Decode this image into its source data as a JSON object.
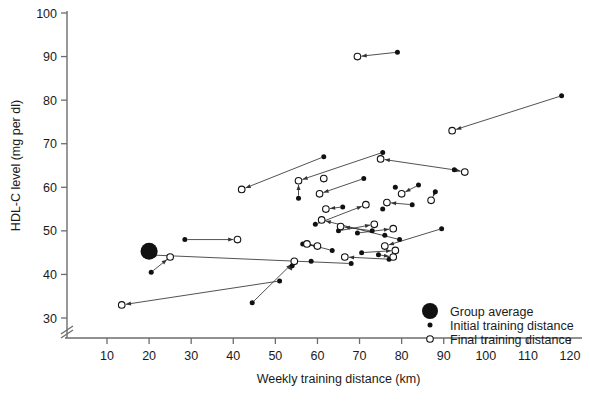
{
  "chart_data": {
    "type": "scatter",
    "title": "",
    "xlabel": "Weekly training distance (km)",
    "ylabel": "HDL-C level (mg per dl)",
    "xlim": [
      0,
      124
    ],
    "ylim": [
      28,
      100
    ],
    "xticks": [
      10,
      20,
      30,
      40,
      50,
      60,
      70,
      80,
      90,
      100,
      110,
      120
    ],
    "yticks": [
      30,
      40,
      50,
      60,
      70,
      80,
      90,
      100
    ],
    "grid": false,
    "y_axis_break": true,
    "legend_position": "bottom-right",
    "legend": [
      {
        "key": "group-average",
        "label": "Group average",
        "marker": "large-filled-circle"
      },
      {
        "key": "initial-training-distance",
        "label": "Initial training distance",
        "marker": "small-filled-circle"
      },
      {
        "key": "final-training-distance",
        "label": "Final training distance",
        "marker": "small-open-circle"
      }
    ],
    "group_average": {
      "x": 20.0,
      "y": 45.3
    },
    "series": [
      {
        "name": "Initial training distance",
        "marker": "filled",
        "points": [
          {
            "x": 79.0,
            "y": 91.0
          },
          {
            "x": 118.0,
            "y": 81.0
          },
          {
            "x": 61.5,
            "y": 67.0
          },
          {
            "x": 75.5,
            "y": 68.0
          },
          {
            "x": 92.5,
            "y": 64.0
          },
          {
            "x": 55.5,
            "y": 57.5
          },
          {
            "x": 71.0,
            "y": 62.0
          },
          {
            "x": 78.5,
            "y": 60.0
          },
          {
            "x": 84.0,
            "y": 60.5
          },
          {
            "x": 88.0,
            "y": 59.0
          },
          {
            "x": 66.0,
            "y": 55.5
          },
          {
            "x": 75.5,
            "y": 55.0
          },
          {
            "x": 82.5,
            "y": 56.0
          },
          {
            "x": 28.5,
            "y": 48.0
          },
          {
            "x": 59.5,
            "y": 51.5
          },
          {
            "x": 65.0,
            "y": 50.0
          },
          {
            "x": 69.5,
            "y": 49.5
          },
          {
            "x": 73.0,
            "y": 50.0
          },
          {
            "x": 76.0,
            "y": 49.0
          },
          {
            "x": 79.5,
            "y": 48.0
          },
          {
            "x": 89.5,
            "y": 50.5
          },
          {
            "x": 56.5,
            "y": 47.0
          },
          {
            "x": 63.5,
            "y": 45.5
          },
          {
            "x": 70.5,
            "y": 45.0
          },
          {
            "x": 74.5,
            "y": 44.5
          },
          {
            "x": 77.0,
            "y": 43.5
          },
          {
            "x": 20.5,
            "y": 40.5
          },
          {
            "x": 54.0,
            "y": 42.0
          },
          {
            "x": 58.5,
            "y": 43.0
          },
          {
            "x": 68.0,
            "y": 42.5
          },
          {
            "x": 51.0,
            "y": 38.5
          },
          {
            "x": 44.5,
            "y": 33.5
          }
        ]
      },
      {
        "name": "Final training distance",
        "marker": "open",
        "points": [
          {
            "x": 69.5,
            "y": 90.0
          },
          {
            "x": 92.0,
            "y": 73.0
          },
          {
            "x": 75.0,
            "y": 66.5
          },
          {
            "x": 95.0,
            "y": 63.5
          },
          {
            "x": 42.0,
            "y": 59.5
          },
          {
            "x": 55.5,
            "y": 61.5
          },
          {
            "x": 61.5,
            "y": 62.0
          },
          {
            "x": 60.5,
            "y": 58.5
          },
          {
            "x": 80.0,
            "y": 58.5
          },
          {
            "x": 87.0,
            "y": 57.0
          },
          {
            "x": 62.0,
            "y": 55.0
          },
          {
            "x": 71.5,
            "y": 56.0
          },
          {
            "x": 76.5,
            "y": 56.5
          },
          {
            "x": 61.0,
            "y": 52.5
          },
          {
            "x": 65.5,
            "y": 51.0
          },
          {
            "x": 73.5,
            "y": 51.5
          },
          {
            "x": 78.0,
            "y": 50.5
          },
          {
            "x": 41.0,
            "y": 48.0
          },
          {
            "x": 57.5,
            "y": 47.0
          },
          {
            "x": 60.0,
            "y": 46.5
          },
          {
            "x": 76.0,
            "y": 46.5
          },
          {
            "x": 78.5,
            "y": 45.5
          },
          {
            "x": 66.5,
            "y": 44.0
          },
          {
            "x": 78.0,
            "y": 44.0
          },
          {
            "x": 19.5,
            "y": 44.5
          },
          {
            "x": 25.0,
            "y": 44.0
          },
          {
            "x": 54.5,
            "y": 43.0
          },
          {
            "x": 13.5,
            "y": 33.0
          }
        ]
      }
    ],
    "arrows": [
      {
        "from": {
          "x": 79.0,
          "y": 91.0
        },
        "to": {
          "x": 69.5,
          "y": 90.0
        }
      },
      {
        "from": {
          "x": 118.0,
          "y": 81.0
        },
        "to": {
          "x": 92.0,
          "y": 73.0
        }
      },
      {
        "from": {
          "x": 61.5,
          "y": 67.0
        },
        "to": {
          "x": 42.0,
          "y": 59.5
        }
      },
      {
        "from": {
          "x": 75.5,
          "y": 68.0
        },
        "to": {
          "x": 55.5,
          "y": 61.5
        }
      },
      {
        "from": {
          "x": 92.5,
          "y": 64.0
        },
        "to": {
          "x": 75.0,
          "y": 66.5
        }
      },
      {
        "from": {
          "x": 92.5,
          "y": 64.0
        },
        "to": {
          "x": 95.0,
          "y": 63.5
        }
      },
      {
        "from": {
          "x": 55.5,
          "y": 57.5
        },
        "to": {
          "x": 55.5,
          "y": 61.5
        }
      },
      {
        "from": {
          "x": 71.0,
          "y": 62.0
        },
        "to": {
          "x": 60.5,
          "y": 58.5
        }
      },
      {
        "from": {
          "x": 88.0,
          "y": 59.0
        },
        "to": {
          "x": 87.0,
          "y": 57.0
        }
      },
      {
        "from": {
          "x": 84.0,
          "y": 60.5
        },
        "to": {
          "x": 80.0,
          "y": 58.5
        }
      },
      {
        "from": {
          "x": 66.0,
          "y": 55.5
        },
        "to": {
          "x": 62.0,
          "y": 55.0
        }
      },
      {
        "from": {
          "x": 82.5,
          "y": 56.0
        },
        "to": {
          "x": 76.5,
          "y": 56.5
        }
      },
      {
        "from": {
          "x": 28.5,
          "y": 48.0
        },
        "to": {
          "x": 41.0,
          "y": 48.0
        }
      },
      {
        "from": {
          "x": 59.5,
          "y": 51.5
        },
        "to": {
          "x": 71.5,
          "y": 56.0
        }
      },
      {
        "from": {
          "x": 65.0,
          "y": 50.0
        },
        "to": {
          "x": 73.5,
          "y": 51.5
        }
      },
      {
        "from": {
          "x": 69.5,
          "y": 49.5
        },
        "to": {
          "x": 78.0,
          "y": 50.5
        }
      },
      {
        "from": {
          "x": 73.0,
          "y": 50.0
        },
        "to": {
          "x": 65.5,
          "y": 51.0
        }
      },
      {
        "from": {
          "x": 79.5,
          "y": 48.0
        },
        "to": {
          "x": 61.0,
          "y": 52.5
        }
      },
      {
        "from": {
          "x": 89.5,
          "y": 50.5
        },
        "to": {
          "x": 76.0,
          "y": 46.5
        }
      },
      {
        "from": {
          "x": 56.5,
          "y": 47.0
        },
        "to": {
          "x": 60.0,
          "y": 46.5
        }
      },
      {
        "from": {
          "x": 63.5,
          "y": 45.5
        },
        "to": {
          "x": 57.5,
          "y": 47.0
        }
      },
      {
        "from": {
          "x": 70.5,
          "y": 45.0
        },
        "to": {
          "x": 78.5,
          "y": 45.5
        }
      },
      {
        "from": {
          "x": 77.0,
          "y": 43.5
        },
        "to": {
          "x": 66.5,
          "y": 44.0
        }
      },
      {
        "from": {
          "x": 74.5,
          "y": 44.5
        },
        "to": {
          "x": 78.0,
          "y": 44.0
        }
      },
      {
        "from": {
          "x": 20.5,
          "y": 40.5
        },
        "to": {
          "x": 25.0,
          "y": 44.0
        }
      },
      {
        "from": {
          "x": 54.0,
          "y": 42.0
        },
        "to": {
          "x": 54.5,
          "y": 43.0
        }
      },
      {
        "from": {
          "x": 68.0,
          "y": 42.5
        },
        "to": {
          "x": 19.5,
          "y": 44.5
        }
      },
      {
        "from": {
          "x": 51.0,
          "y": 38.5
        },
        "to": {
          "x": 13.5,
          "y": 33.0
        }
      },
      {
        "from": {
          "x": 44.5,
          "y": 33.5
        },
        "to": {
          "x": 54.5,
          "y": 43.0
        }
      }
    ]
  }
}
